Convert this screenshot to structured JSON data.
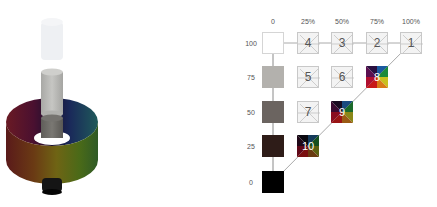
{
  "illustration": {
    "description": "3D color cylinder with lightness column (white top, gray middle, black bottom) and hue ring",
    "colors": {
      "top_cylinder": "#eef0f3",
      "middle_cylinder": "#b9b9b6",
      "inner_cylinder": "#6e6c68",
      "bottom_cylinder": "#111111"
    }
  },
  "grid": {
    "column_labels": [
      "0",
      "25%",
      "50%",
      "75%",
      "100%"
    ],
    "row_labels": [
      "100",
      "75",
      "50",
      "25",
      "0"
    ],
    "gray_column": [
      {
        "row": "100",
        "color": "#ffffff"
      },
      {
        "row": "75",
        "color": "#b3b1ad"
      },
      {
        "row": "50",
        "color": "#6b6460"
      },
      {
        "row": "25",
        "color": "#2e1c18"
      },
      {
        "row": "0",
        "color": "#000000"
      }
    ],
    "cells": [
      {
        "id": "4",
        "row": "100",
        "col": "25%",
        "type": "empty"
      },
      {
        "id": "3",
        "row": "100",
        "col": "50%",
        "type": "empty"
      },
      {
        "id": "2",
        "row": "100",
        "col": "75%",
        "type": "empty"
      },
      {
        "id": "1",
        "row": "100",
        "col": "100%",
        "type": "empty"
      },
      {
        "id": "5",
        "row": "75",
        "col": "25%",
        "type": "empty"
      },
      {
        "id": "6",
        "row": "75",
        "col": "50%",
        "type": "empty"
      },
      {
        "id": "8",
        "row": "75",
        "col": "75%",
        "type": "hue"
      },
      {
        "id": "7",
        "row": "50",
        "col": "25%",
        "type": "empty"
      },
      {
        "id": "9",
        "row": "50",
        "col": "50%",
        "type": "hue"
      },
      {
        "id": "10",
        "row": "25",
        "col": "25%",
        "type": "hue"
      }
    ]
  }
}
